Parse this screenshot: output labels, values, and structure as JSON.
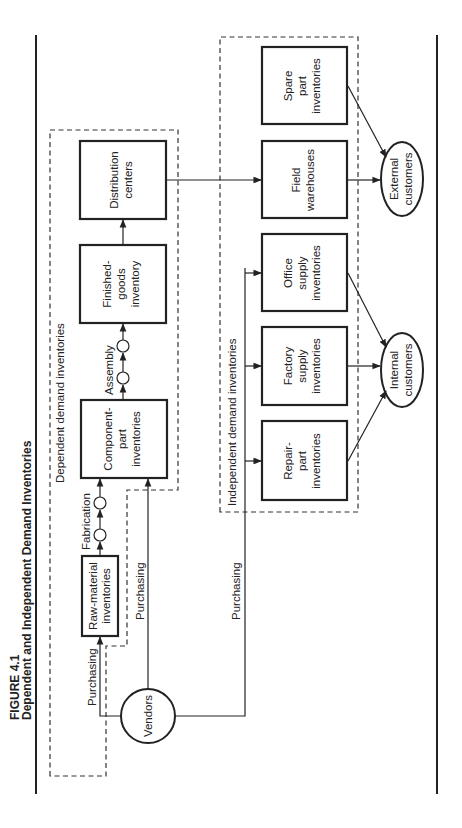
{
  "figure": {
    "number": "FIGURE 4.1",
    "title": "Dependent and Independent Demand Inventories"
  },
  "groups": {
    "dependent": "Dependent demand inventories",
    "independent": "Independent demand inventories"
  },
  "nodes": {
    "vendors": "Vendors",
    "raw_material": [
      "Raw-material",
      "inventories"
    ],
    "component_part": [
      "Component-",
      "part",
      "inventories"
    ],
    "finished_goods": [
      "Finished-",
      "goods",
      "inventory"
    ],
    "distribution": [
      "Distribution",
      "centers"
    ],
    "field_warehouses": [
      "Field",
      "warehouses"
    ],
    "spare_part": [
      "Spare",
      "part",
      "inventories"
    ],
    "office_supply": [
      "Office",
      "supply",
      "inventories"
    ],
    "factory_supply": [
      "Factory",
      "supply",
      "inventories"
    ],
    "repair_part": [
      "Repair-",
      "part",
      "inventories"
    ],
    "external_customers": [
      "External",
      "customers"
    ],
    "internal_customers": [
      "Internal",
      "customers"
    ]
  },
  "edges": {
    "purchasing_raw": "Purchasing",
    "purchasing_component": "Purchasing",
    "purchasing_independent": "Purchasing",
    "fabrication": "Fabrication",
    "assembly": "Assembly"
  }
}
